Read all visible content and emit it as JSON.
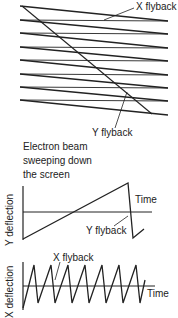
{
  "raster": {
    "x_flyback_label": "X flyback",
    "y_flyback_label": "Y flyback",
    "caption_lines": [
      "Electron beam",
      "sweeping down",
      "the screen"
    ]
  },
  "y_graph": {
    "axis_label": "Y deflection",
    "time_label": "Time",
    "flyback_label": "Y flyback"
  },
  "x_graph": {
    "axis_label": "X deflection",
    "time_label": "Time",
    "flyback_label": "X flyback"
  },
  "colors": {
    "line": "#222222",
    "background": "#ffffff"
  }
}
